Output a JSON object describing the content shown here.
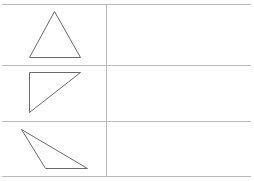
{
  "table": {
    "rows": 3,
    "columns": 2,
    "colors": {
      "grid_line": "#b8b8b8",
      "shape_stroke": "#6a6a6a",
      "background": "#ffffff"
    },
    "horizontal_lines_y": [
      4,
      65,
      121,
      176
    ],
    "vertical_divider_x": 106,
    "x_start": 2,
    "x_end": 251
  },
  "cells": [
    {
      "row": 0,
      "left": {
        "shape": "triangle",
        "kind": "acute-isosceles",
        "points": [
          [
            54,
            11
          ],
          [
            29,
            57
          ],
          [
            80,
            57
          ]
        ]
      },
      "right": {
        "content": ""
      }
    },
    {
      "row": 1,
      "left": {
        "shape": "triangle",
        "kind": "right",
        "points": [
          [
            29,
            72
          ],
          [
            80,
            72
          ],
          [
            29,
            112
          ]
        ]
      },
      "right": {
        "content": ""
      }
    },
    {
      "row": 2,
      "left": {
        "shape": "triangle",
        "kind": "obtuse",
        "points": [
          [
            21,
            129
          ],
          [
            45,
            168
          ],
          [
            87,
            168
          ]
        ]
      },
      "right": {
        "content": ""
      }
    }
  ]
}
